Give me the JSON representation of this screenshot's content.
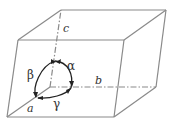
{
  "diagram": {
    "type": "unit-cell-parallelepiped",
    "colors": {
      "edge": "#8a8a8a",
      "text": "#333333",
      "arc": "#222222"
    },
    "axis_labels": {
      "a": "a",
      "b": "b",
      "c": "c"
    },
    "angle_labels": {
      "alpha": "α",
      "beta": "β",
      "gamma": "γ"
    }
  }
}
